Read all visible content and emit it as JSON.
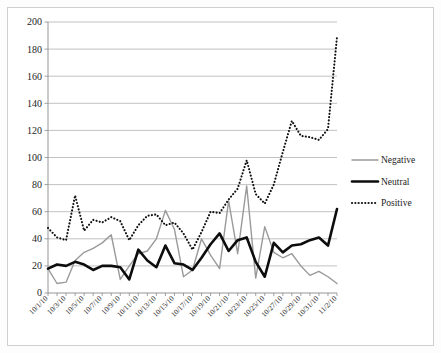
{
  "chart_data": {
    "type": "line",
    "title": "",
    "xlabel": "",
    "ylabel": "",
    "ylim": [
      0,
      200
    ],
    "ytick_step": 20,
    "yticks": [
      0,
      20,
      40,
      60,
      80,
      100,
      120,
      140,
      160,
      180,
      200
    ],
    "grid": true,
    "legend_position": "right",
    "x": [
      "10/1/10",
      "10/2/10",
      "10/3/10",
      "10/4/10",
      "10/5/10",
      "10/6/10",
      "10/7/10",
      "10/8/10",
      "10/9/10",
      "10/10/10",
      "10/11/10",
      "10/12/10",
      "10/13/10",
      "10/14/10",
      "10/15/10",
      "10/16/10",
      "10/17/10",
      "10/18/10",
      "10/19/10",
      "10/20/10",
      "10/21/10",
      "10/22/10",
      "10/23/10",
      "10/24/10",
      "10/25/10",
      "10/26/10",
      "10/27/10",
      "10/28/10",
      "10/29/10",
      "10/30/10",
      "10/31/10",
      "11/1/10",
      "11/2/10"
    ],
    "xtick_labels": [
      "10/1/10",
      "10/3/10",
      "10/5/10",
      "10/7/10",
      "10/9/10",
      "10/11/10",
      "10/13/10",
      "10/15/10",
      "10/17/10",
      "10/19/10",
      "10/21/10",
      "10/23/10",
      "10/25/10",
      "10/27/10",
      "10/29/10",
      "10/31/10",
      "11/2/10"
    ],
    "series": [
      {
        "name": "Negative",
        "color": "#9a9a9a",
        "style": "solid",
        "width": 1.4,
        "values": [
          18,
          7,
          8,
          24,
          30,
          33,
          37,
          43,
          10,
          20,
          29,
          31,
          40,
          61,
          47,
          12,
          17,
          40,
          28,
          18,
          68,
          29,
          79,
          11,
          49,
          30,
          26,
          29,
          20,
          13,
          16,
          12,
          7
        ]
      },
      {
        "name": "Neutral",
        "color": "#0d0d0d",
        "style": "solid",
        "width": 2.6,
        "values": [
          18,
          21,
          20,
          23,
          21,
          17,
          20,
          20,
          19,
          10,
          32,
          24,
          19,
          35,
          22,
          21,
          17,
          26,
          36,
          44,
          31,
          39,
          41,
          23,
          12,
          37,
          30,
          35,
          36,
          39,
          41,
          35,
          62
        ]
      },
      {
        "name": "Positive",
        "color": "#111111",
        "style": "dotted",
        "width": 2.1,
        "values": [
          48,
          41,
          39,
          72,
          46,
          54,
          52,
          56,
          53,
          39,
          50,
          57,
          58,
          50,
          52,
          44,
          32,
          45,
          60,
          59,
          69,
          77,
          98,
          73,
          66,
          80,
          104,
          127,
          116,
          115,
          113,
          121,
          189
        ]
      }
    ]
  },
  "legend": {
    "items": [
      {
        "label": "Negative"
      },
      {
        "label": "Neutral"
      },
      {
        "label": "Positive"
      }
    ]
  },
  "axis": {
    "y_labels": [
      "200",
      "180",
      "160",
      "140",
      "120",
      "100",
      "80",
      "60",
      "40",
      "20",
      "0"
    ]
  }
}
